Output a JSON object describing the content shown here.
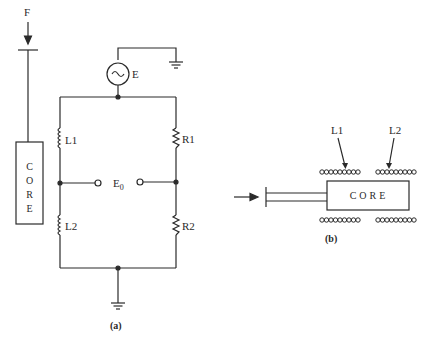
{
  "figure_a": {
    "caption": "(a)",
    "force_label": "F",
    "core_letters": [
      "C",
      "O",
      "R",
      "E"
    ],
    "source_label": "E",
    "source_symbol": "~",
    "output_label": "E",
    "output_subscript": "0",
    "components": {
      "l1": "L1",
      "l2": "L2",
      "r1": "R1",
      "r2": "R2"
    }
  },
  "figure_b": {
    "caption": "(b)",
    "core_label": "CORE",
    "coil_labels": {
      "l1": "L1",
      "l2": "L2"
    }
  },
  "colors": {
    "ink": "#2a2a2a",
    "background": "#ffffff"
  }
}
